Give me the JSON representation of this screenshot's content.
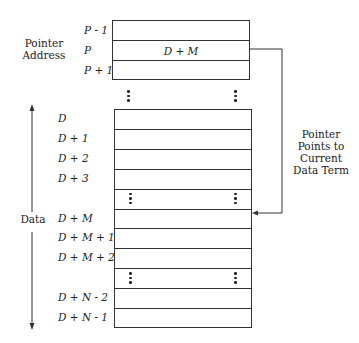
{
  "pointer_section": {
    "caption_line1": "Pointer",
    "caption_line2": "Address",
    "row_labels": [
      "P - 1",
      "P",
      "P + 1"
    ],
    "cells": [
      "",
      "D + M",
      ""
    ]
  },
  "annotation": {
    "line1": "Pointer",
    "line2": "Points to",
    "line3": "Current",
    "line4": "Data Term"
  },
  "data_section": {
    "caption": "Data",
    "row_labels": [
      "D",
      "D + 1",
      "D + 2",
      "D + 3",
      "",
      "D + M",
      "D + M + 1",
      "D + M + 2",
      "",
      "D + N - 2",
      "D + N - 1"
    ],
    "ellipsis_rows": [
      4,
      8
    ],
    "pointed_row": 5
  }
}
